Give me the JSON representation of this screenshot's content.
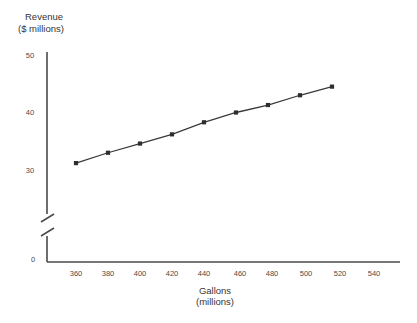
{
  "chart_data": {
    "type": "line",
    "title": "",
    "xlabel": "Gallons (millions)",
    "ylabel": "Revenue ($ millions)",
    "ylabel_line1": "Revenue",
    "ylabel_line2": "($ millions)",
    "xlabel_line1": "Gallons",
    "xlabel_line2": "(millions)",
    "x": [
      360,
      380,
      400,
      420,
      440,
      460,
      480,
      500,
      520
    ],
    "values": [
      31.2,
      33.0,
      34.6,
      36.2,
      38.3,
      40.0,
      41.3,
      43.0,
      44.5
    ],
    "series": [
      {
        "name": "Revenue",
        "values": [
          31.2,
          33.0,
          34.6,
          36.2,
          38.3,
          40.0,
          41.3,
          43.0,
          44.5
        ]
      }
    ],
    "xticks": [
      360,
      380,
      400,
      420,
      440,
      460,
      480,
      500,
      520,
      540
    ],
    "xtick_labels": [
      "360",
      "380",
      "400",
      "420",
      "440",
      "460",
      "480",
      "500",
      "520",
      "540"
    ],
    "yticks": [
      0,
      30,
      40,
      50
    ],
    "ytick_labels": [
      "0",
      "30",
      "40",
      "50"
    ],
    "xlim": [
      350,
      548
    ],
    "ylim": [
      28.5,
      51.5
    ],
    "axis_break": true,
    "axis_break_note": "y-axis broken between 0 and 30",
    "grid": false,
    "legend": null,
    "marker": "square",
    "line_color": "#3a3a3a",
    "marker_color": "#2e2e2e",
    "background_color": "#ffffff"
  },
  "figure": {
    "bottom_text_fragment": "___  __  _  _  _  _ _  _  _"
  }
}
